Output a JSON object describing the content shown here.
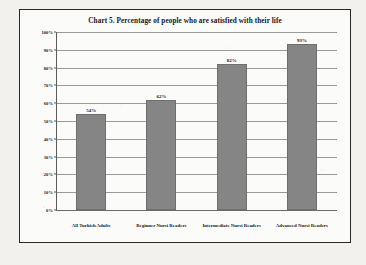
{
  "chart_data": {
    "type": "bar",
    "title": "Chart 5. Percentage of people who are satisfied with their life",
    "xlabel": "",
    "ylabel": "",
    "categories": [
      "All Turkish Adults",
      "Beginner Nursi Readers",
      "Intermediate Nursi Readers",
      "Advanced Nursi Readers"
    ],
    "values": [
      54,
      62,
      82,
      93
    ],
    "value_labels": [
      "54%",
      "62%",
      "82%",
      "93%"
    ],
    "ylim": [
      0,
      100
    ],
    "ytick_labels": [
      "100%",
      "90%",
      "80%",
      "70%",
      "60%",
      "50%",
      "40%",
      "30%",
      "20%",
      "10%",
      "0%"
    ],
    "ytick_values": [
      100,
      90,
      80,
      70,
      60,
      50,
      40,
      30,
      20,
      10,
      0
    ],
    "grid": true,
    "legend": "none",
    "bar_color": "#858585",
    "plot_background": "#fbfbf9",
    "frame_color": "#2a2a2a",
    "gridline_color": "#9a9a9a"
  }
}
